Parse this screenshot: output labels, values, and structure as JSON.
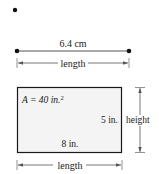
{
  "top": {
    "segment_label": "6.4 cm",
    "length_label": "length"
  },
  "rectangle": {
    "area_prefix": "A = 40 in.",
    "area_exponent": "2",
    "side_label": "5 in.",
    "bottom_label": "8 in.",
    "height_label": "height",
    "length_label": "length",
    "fill_color": "#f4f4f4",
    "stroke_color": "#1a1a1a"
  }
}
